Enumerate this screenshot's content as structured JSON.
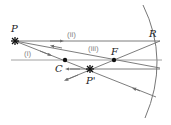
{
  "diagram": {
    "colors": {
      "ray": "#6e6e6e",
      "axis": "#8a8a8a",
      "mirror": "#777777",
      "point": "#111111",
      "label": "#222222",
      "ray_label": "#8a8a8a"
    },
    "points": {
      "object": {
        "label": "P",
        "x": 15,
        "y": 41
      },
      "image": {
        "label": "P'",
        "x": 90,
        "y": 69
      },
      "center": {
        "label": "C",
        "x": 65,
        "y": 60
      },
      "focus": {
        "label": "F",
        "x": 114,
        "y": 60
      },
      "reflection": {
        "label": "R",
        "x": 161,
        "y": 41
      }
    },
    "rays": [
      {
        "label": "(i)",
        "description": "ray through C, reflects back on itself"
      },
      {
        "label": "(ii)",
        "description": "ray parallel to axis, reflects through F"
      },
      {
        "label": "(iii)",
        "description": "ray through F, reflects parallel to axis"
      }
    ],
    "principal_axis": {
      "x1": 11,
      "x2": 162,
      "y": 60
    }
  }
}
